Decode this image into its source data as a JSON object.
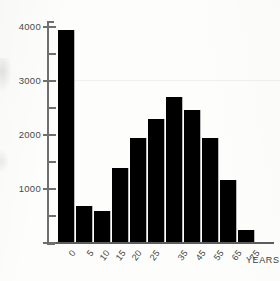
{
  "chart_data": {
    "type": "bar",
    "title": "",
    "subtitle": "",
    "xlabel": "YEARS",
    "ylabel": "",
    "categories": [
      "0",
      "5",
      "10",
      "15",
      "20",
      "25",
      "35",
      "45",
      "55",
      "65",
      "75"
    ],
    "values": [
      3930,
      660,
      580,
      1370,
      1930,
      2270,
      2690,
      2440,
      1930,
      1150,
      230
    ],
    "ylim": [
      0,
      4100
    ],
    "y_major_ticks": [
      1000,
      2000,
      3000,
      4000
    ],
    "y_major_tick_labels": [
      "1000",
      "2000",
      "3000",
      "4000"
    ],
    "y_minor_ticks": [
      500,
      1500,
      2500,
      3500
    ],
    "grid": false,
    "legend": null,
    "legend_position": "none",
    "bar_color": "#000000",
    "axis_color": "#6f6f6f",
    "background_color": "#fdfdfb"
  },
  "axis": {
    "unit_label": "YEARS"
  }
}
